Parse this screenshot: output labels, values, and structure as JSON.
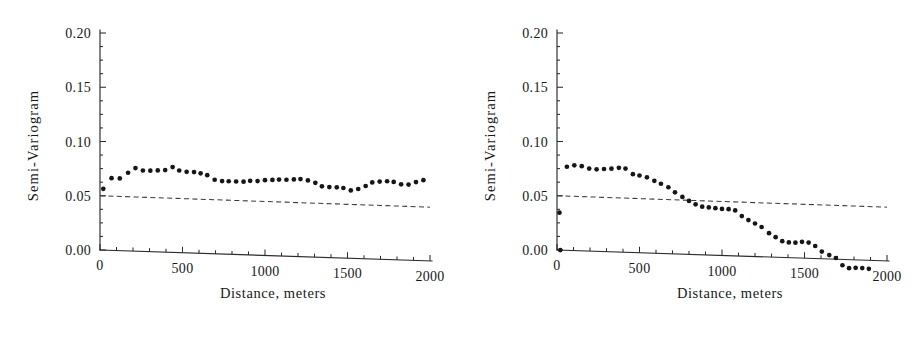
{
  "figure": {
    "background_color": "#ffffff",
    "ink_color": "#161616",
    "panel_count": 2
  },
  "chart_data": [
    {
      "type": "scatter",
      "panel": "left",
      "title": "",
      "xlabel": "Distance, meters",
      "ylabel": "Semi-Variogram",
      "xlim": [
        0,
        2000
      ],
      "ylim": [
        0.0,
        0.2
      ],
      "xticks": [
        0,
        500,
        1000,
        1500,
        2000
      ],
      "xticklabels": [
        "0",
        "500",
        "1000",
        "1500",
        "2000"
      ],
      "yticks": [
        0.0,
        0.05,
        0.1,
        0.15,
        0.2
      ],
      "yticklabels": [
        "0.00",
        "0.05",
        "0.10",
        "0.15",
        "0.20"
      ],
      "minor_xtick_interval": 100,
      "minor_ytick_interval": 0.0125,
      "grid": false,
      "legend": null,
      "series": [
        {
          "name": "experimental semi-variogram",
          "marker": "filled-circle",
          "color": "#161616",
          "x": [
            20,
            70,
            120,
            170,
            215,
            260,
            305,
            350,
            395,
            440,
            480,
            525,
            570,
            610,
            650,
            695,
            740,
            780,
            825,
            870,
            910,
            955,
            1000,
            1045,
            1085,
            1130,
            1175,
            1215,
            1260,
            1305,
            1345,
            1390,
            1435,
            1475,
            1520,
            1565,
            1610,
            1650,
            1695,
            1740,
            1780,
            1825,
            1870,
            1915,
            1960
          ],
          "y": [
            0.0565,
            0.0665,
            0.0665,
            0.072,
            0.0765,
            0.0745,
            0.0745,
            0.075,
            0.0755,
            0.0785,
            0.0755,
            0.0745,
            0.0745,
            0.0735,
            0.072,
            0.068,
            0.067,
            0.067,
            0.067,
            0.067,
            0.068,
            0.068,
            0.069,
            0.0695,
            0.07,
            0.07,
            0.0705,
            0.071,
            0.07,
            0.068,
            0.065,
            0.0645,
            0.0645,
            0.064,
            0.062,
            0.0635,
            0.0665,
            0.07,
            0.071,
            0.0715,
            0.071,
            0.069,
            0.069,
            0.0715,
            0.0735
          ]
        }
      ],
      "reference_line": {
        "name": "sample variance reference",
        "style": "dashed",
        "color": "#3a3a3a",
        "x": [
          0,
          2000
        ],
        "y": [
          0.05,
          0.042
        ]
      }
    },
    {
      "type": "scatter",
      "panel": "right",
      "title": "",
      "xlabel": "Distance, meters",
      "ylabel": "Semi-Variogram",
      "xlim": [
        0,
        2000
      ],
      "ylim": [
        0.0,
        0.2
      ],
      "xticks": [
        0,
        500,
        1000,
        1500,
        2000
      ],
      "xticklabels": [
        "0",
        "500",
        "1000",
        "1500",
        "2000"
      ],
      "yticks": [
        0.0,
        0.05,
        0.1,
        0.15,
        0.2
      ],
      "yticklabels": [
        "0.00",
        "0.05",
        "0.10",
        "0.15",
        "0.20"
      ],
      "minor_xtick_interval": 100,
      "minor_ytick_interval": 0.0125,
      "grid": false,
      "legend": null,
      "series": [
        {
          "name": "experimental semi-variogram",
          "marker": "filled-circle",
          "color": "#161616",
          "x": [
            15,
            20,
            60,
            105,
            150,
            195,
            240,
            285,
            330,
            375,
            415,
            460,
            500,
            545,
            590,
            630,
            675,
            715,
            760,
            800,
            840,
            880,
            920,
            960,
            1000,
            1040,
            1080,
            1120,
            1160,
            1200,
            1240,
            1285,
            1325,
            1365,
            1405,
            1445,
            1485,
            1525,
            1565,
            1605,
            1650,
            1690,
            1730,
            1770,
            1810,
            1850,
            1890
          ],
          "y": [
            0.0345,
            0.0,
            0.077,
            0.0785,
            0.078,
            0.076,
            0.0755,
            0.076,
            0.0765,
            0.0775,
            0.077,
            0.072,
            0.071,
            0.0695,
            0.0665,
            0.064,
            0.061,
            0.0565,
            0.0525,
            0.049,
            0.046,
            0.044,
            0.0435,
            0.043,
            0.0425,
            0.0425,
            0.0415,
            0.0365,
            0.033,
            0.03,
            0.027,
            0.0215,
            0.018,
            0.0145,
            0.0135,
            0.0135,
            0.0145,
            0.014,
            0.011,
            0.006,
            0.003,
            0.0005,
            -0.006,
            -0.0085,
            -0.008,
            -0.008,
            -0.0085
          ]
        }
      ],
      "reference_line": {
        "name": "sample variance reference",
        "style": "dashed",
        "color": "#3a3a3a",
        "x": [
          0,
          2000
        ],
        "y": [
          0.05,
          0.042
        ]
      }
    }
  ]
}
